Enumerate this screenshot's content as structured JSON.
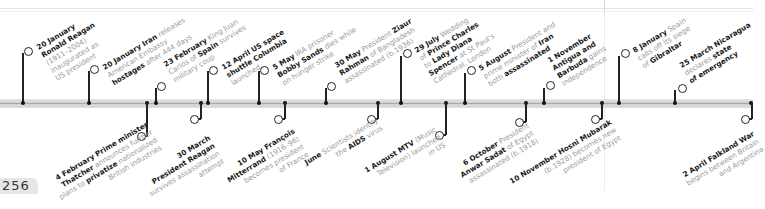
{
  "page": {
    "number": "256"
  },
  "colors": {
    "bold_text": "#1a1a1a",
    "light_text": "#9a9a9a",
    "bar": "#d6d6d6",
    "marker": "#222222"
  },
  "events_above": [
    {
      "bold": "20 January",
      "lines": [
        [
          "b",
          "Ronald Reagan"
        ],
        [
          "t",
          "(1911–2004)"
        ],
        [
          "t",
          "inaugurated as"
        ],
        [
          "t",
          "US president"
        ]
      ]
    },
    {
      "bold": "20 January Iran",
      "lines": [
        [
          "t",
          " releases"
        ],
        [
          "t",
          "American Embassy"
        ],
        [
          "b",
          "hostages"
        ],
        [
          "t",
          " after 444 days"
        ]
      ]
    },
    {
      "bold": "23 February",
      "lines": [
        [
          "t",
          " King Juan"
        ],
        [
          "t",
          "Carlos of "
        ],
        [
          "b",
          "Spain"
        ],
        [
          "t",
          " survives"
        ],
        [
          "t",
          "military coup"
        ]
      ]
    },
    {
      "bold": "12 April US space",
      "lines": [
        [
          "b",
          "shuttle Columbia"
        ],
        [
          "t",
          "launched"
        ]
      ]
    },
    {
      "bold": "5 May",
      "lines": [
        [
          "t",
          " IRA prisoner"
        ],
        [
          "b",
          "Bobby Sands"
        ],
        [
          "t",
          " dies while"
        ],
        [
          "t",
          "on hunger strike"
        ]
      ]
    },
    {
      "bold": "30 May",
      "lines": [
        [
          "t",
          " President "
        ],
        [
          "b",
          "Ziaur"
        ],
        [
          "b",
          "Rahman"
        ],
        [
          "t",
          " of Bangladesh"
        ],
        [
          "t",
          "assassinated (b.1936)"
        ]
      ]
    },
    {
      "bold": "29 July",
      "lines": [
        [
          "t",
          " Wedding"
        ],
        [
          "t",
          "of "
        ],
        [
          "b",
          "Prince Charles"
        ],
        [
          "t",
          "to "
        ],
        [
          "b",
          "Lady Diana"
        ],
        [
          "b",
          "Spencer"
        ],
        [
          "t",
          " at St Paul's"
        ],
        [
          "t",
          "Cathedral, London"
        ]
      ]
    },
    {
      "bold": "5 August",
      "lines": [
        [
          "t",
          " President and"
        ],
        [
          "t",
          "prime minister of "
        ],
        [
          "b",
          "Iran"
        ],
        [
          "t",
          "both "
        ],
        [
          "b",
          "assassinated"
        ]
      ]
    },
    {
      "bold": "1 November",
      "lines": [
        [
          "b",
          "Antigua and"
        ],
        [
          "b",
          "Barbuda"
        ],
        [
          "t",
          " gains"
        ],
        [
          "t",
          "independence"
        ]
      ]
    },
    {
      "bold": "8 January",
      "lines": [
        [
          "t",
          " Spain"
        ],
        [
          "t",
          "calls off its siege"
        ],
        [
          "t",
          "of "
        ],
        [
          "b",
          "Gibraltar"
        ]
      ]
    },
    {
      "bold": "25 March Nicaragua",
      "lines": [
        [
          "t",
          "declares "
        ],
        [
          "b",
          "state"
        ],
        [
          "b",
          "of emergency"
        ]
      ]
    }
  ],
  "events_below": [
    {
      "bold": "4 February Prime minister",
      "lines": [
        [
          "b",
          "Thatcher"
        ],
        [
          "t",
          " announces further"
        ],
        [
          "t",
          "plans to "
        ],
        [
          "b",
          "privatize"
        ],
        [
          "t",
          " nationalized"
        ],
        [
          "t",
          "British industries"
        ]
      ]
    },
    {
      "bold": "30 March",
      "lines": [
        [
          "b",
          "President Reagan"
        ],
        [
          "t",
          "survives assassination"
        ],
        [
          "t",
          "attempt"
        ]
      ]
    },
    {
      "bold": "10 May François",
      "lines": [
        [
          "b",
          "Mitterrand"
        ],
        [
          "t",
          " (1916–96)"
        ],
        [
          "t",
          "becomes president"
        ],
        [
          "t",
          "of France"
        ]
      ]
    },
    {
      "bold": "June",
      "lines": [
        [
          "t",
          " Scientists identify"
        ],
        [
          "t",
          "the "
        ],
        [
          "b",
          "AIDS"
        ],
        [
          "t",
          " virus"
        ]
      ]
    },
    {
      "bold": "1 August MTV",
      "lines": [
        [
          "t",
          " (Music"
        ],
        [
          "t",
          "Television) launched"
        ],
        [
          "t",
          "in US"
        ]
      ]
    },
    {
      "bold": "6 October",
      "lines": [
        [
          "t",
          " President"
        ],
        [
          "b",
          "Anwar Sadat"
        ],
        [
          "t",
          " of Egypt"
        ],
        [
          "t",
          "assassinated (b.1918)"
        ]
      ]
    },
    {
      "bold": "10 November Hosni Mubarak",
      "lines": [
        [
          "t",
          "(b.1928) becomes new"
        ],
        [
          "t",
          "president of Egypt"
        ]
      ]
    },
    {
      "bold": "2 April Falkland War",
      "lines": [
        [
          "t",
          "begins between Britain"
        ],
        [
          "t",
          "and Argentina"
        ]
      ]
    }
  ],
  "labels": {
    "a0": [
      "20 January",
      "Ronald Reagan",
      "(1911–2004)",
      "inaugurated as",
      "US president"
    ],
    "a1": [
      "20 January Iran",
      " releases",
      "American Embassy",
      "hostages",
      " after 444 days"
    ],
    "a2": [
      "23 February",
      " King Juan",
      "Carlos of ",
      "Spain",
      " survives",
      "military coup"
    ],
    "a3": [
      "12 April US space",
      "shuttle Columbia",
      "launched"
    ],
    "a4": [
      "5 May",
      " IRA prisoner",
      "Bobby Sands",
      " dies while",
      "on hunger strike"
    ],
    "a5": [
      "30 May",
      " President ",
      "Ziaur",
      "Rahman",
      " of Bangladesh",
      "assassinated (b.1936)"
    ],
    "a6": [
      "29 July",
      " Wedding",
      "of ",
      "Prince Charles",
      "to ",
      "Lady Diana",
      "Spencer",
      " at St Paul's",
      "Cathedral, London"
    ],
    "a7": [
      "5 August",
      " President and",
      "prime minister of ",
      "Iran",
      "both ",
      "assassinated"
    ],
    "a8": [
      "1 November",
      "Antigua and",
      "Barbuda",
      " gains",
      "independence"
    ],
    "a9": [
      "8 January",
      " Spain",
      "calls off its siege",
      "of ",
      "Gibraltar"
    ],
    "a10": [
      "25 March Nicaragua",
      "declares ",
      "state",
      "of emergency"
    ],
    "b0": [
      "4 February Prime minister",
      "Thatcher",
      " announces further",
      "plans to ",
      "privatize",
      " nationalized",
      "British industries"
    ],
    "b1": [
      "30 March",
      "President Reagan",
      "survives assassination",
      "attempt"
    ],
    "b2": [
      "10 May François",
      "Mitterrand",
      " (1916–96)",
      "becomes president",
      "of France"
    ],
    "b3": [
      "June",
      " Scientists identify",
      "the ",
      "AIDS",
      " virus"
    ],
    "b4": [
      "1 August MTV",
      " (Music",
      "Television) launched",
      "in US"
    ],
    "b5": [
      "6 October",
      " President",
      "Anwar Sadat",
      " of Egypt",
      "assassinated (b.1918)"
    ],
    "b6": [
      "10 November Hosni Mubarak",
      "(b.1928) becomes new",
      "president of Egypt"
    ],
    "b7": [
      "2 April Falkland War",
      "begins between Britain",
      "and Argentina"
    ]
  }
}
